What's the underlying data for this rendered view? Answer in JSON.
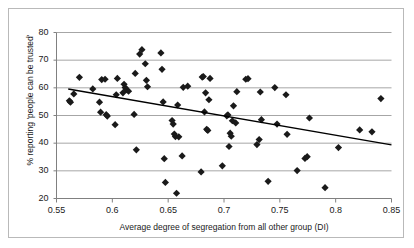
{
  "chart_data": {
    "type": "scatter",
    "title": "",
    "xlabel": "Average degree of segregation from all other group (DI)",
    "ylabel": "% reporting 'people can be trusted'",
    "xlim": [
      0.55,
      0.85
    ],
    "ylim": [
      20,
      80
    ],
    "xticks": [
      "0.55",
      "0.6",
      "0.65",
      "0.7",
      "0.75",
      "0.8",
      "0.85"
    ],
    "xtick_values": [
      0.55,
      0.6,
      0.65,
      0.7,
      0.75,
      0.8,
      0.85
    ],
    "yticks": [
      "80",
      "70",
      "60",
      "50",
      "40",
      "30",
      "20"
    ],
    "ytick_values": [
      80,
      70,
      60,
      50,
      40,
      30,
      20
    ],
    "grid": "horizontal",
    "legend": "none",
    "marker": "diamond",
    "marker_color": "#1a1a1a",
    "grid_color": "#a6a6a6",
    "axis_color": "#808080",
    "trendline_color": "#000000",
    "trendline": {
      "x": [
        0.5605,
        0.85
      ],
      "y": [
        59.6,
        39.4
      ]
    },
    "points": [
      {
        "x": 0.5615,
        "y": 55.3
      },
      {
        "x": 0.5625,
        "y": 54.8
      },
      {
        "x": 0.5655,
        "y": 57.8
      },
      {
        "x": 0.5705,
        "y": 63.8
      },
      {
        "x": 0.5825,
        "y": 59.6
      },
      {
        "x": 0.5885,
        "y": 54.8
      },
      {
        "x": 0.5895,
        "y": 51.2
      },
      {
        "x": 0.5905,
        "y": 63.0
      },
      {
        "x": 0.5935,
        "y": 63.1
      },
      {
        "x": 0.5945,
        "y": 50.3
      },
      {
        "x": 0.5955,
        "y": 49.8
      },
      {
        "x": 0.6025,
        "y": 46.7
      },
      {
        "x": 0.6035,
        "y": 57.5
      },
      {
        "x": 0.6045,
        "y": 63.4
      },
      {
        "x": 0.6095,
        "y": 58.2
      },
      {
        "x": 0.6105,
        "y": 61.3
      },
      {
        "x": 0.6115,
        "y": 60.1
      },
      {
        "x": 0.6125,
        "y": 59.3
      },
      {
        "x": 0.6145,
        "y": 58.8
      },
      {
        "x": 0.6195,
        "y": 50.4
      },
      {
        "x": 0.6205,
        "y": 65.2
      },
      {
        "x": 0.6215,
        "y": 37.6
      },
      {
        "x": 0.6245,
        "y": 72.2
      },
      {
        "x": 0.6265,
        "y": 73.8
      },
      {
        "x": 0.6295,
        "y": 68.7
      },
      {
        "x": 0.6305,
        "y": 62.7
      },
      {
        "x": 0.6315,
        "y": 60.4
      },
      {
        "x": 0.6435,
        "y": 72.6
      },
      {
        "x": 0.6445,
        "y": 66.7
      },
      {
        "x": 0.6455,
        "y": 54.9
      },
      {
        "x": 0.6465,
        "y": 34.4
      },
      {
        "x": 0.6475,
        "y": 25.8
      },
      {
        "x": 0.6535,
        "y": 48.2
      },
      {
        "x": 0.6545,
        "y": 46.9
      },
      {
        "x": 0.6555,
        "y": 43.3
      },
      {
        "x": 0.6565,
        "y": 42.4
      },
      {
        "x": 0.6575,
        "y": 21.9
      },
      {
        "x": 0.6585,
        "y": 53.8
      },
      {
        "x": 0.6595,
        "y": 42.3
      },
      {
        "x": 0.6625,
        "y": 35.4
      },
      {
        "x": 0.6635,
        "y": 60.2
      },
      {
        "x": 0.6675,
        "y": 60.6
      },
      {
        "x": 0.6795,
        "y": 29.6
      },
      {
        "x": 0.6805,
        "y": 63.9
      },
      {
        "x": 0.6815,
        "y": 64.1
      },
      {
        "x": 0.6825,
        "y": 51.3
      },
      {
        "x": 0.6835,
        "y": 58.2
      },
      {
        "x": 0.6845,
        "y": 45.0
      },
      {
        "x": 0.6855,
        "y": 44.6
      },
      {
        "x": 0.6865,
        "y": 55.7
      },
      {
        "x": 0.6875,
        "y": 63.4
      },
      {
        "x": 0.6985,
        "y": 31.8
      },
      {
        "x": 0.7025,
        "y": 49.9
      },
      {
        "x": 0.7035,
        "y": 50.2
      },
      {
        "x": 0.7045,
        "y": 38.8
      },
      {
        "x": 0.7055,
        "y": 43.6
      },
      {
        "x": 0.7065,
        "y": 42.5
      },
      {
        "x": 0.7075,
        "y": 48.1
      },
      {
        "x": 0.7085,
        "y": 53.5
      },
      {
        "x": 0.7105,
        "y": 47.3
      },
      {
        "x": 0.7115,
        "y": 58.6
      },
      {
        "x": 0.7195,
        "y": 63.1
      },
      {
        "x": 0.7215,
        "y": 63.3
      },
      {
        "x": 0.7295,
        "y": 39.5
      },
      {
        "x": 0.7315,
        "y": 41.3
      },
      {
        "x": 0.7325,
        "y": 58.5
      },
      {
        "x": 0.7335,
        "y": 48.5
      },
      {
        "x": 0.7395,
        "y": 26.2
      },
      {
        "x": 0.7455,
        "y": 60.1
      },
      {
        "x": 0.7475,
        "y": 46.9
      },
      {
        "x": 0.7555,
        "y": 57.5
      },
      {
        "x": 0.7565,
        "y": 43.2
      },
      {
        "x": 0.7655,
        "y": 30.1
      },
      {
        "x": 0.7725,
        "y": 34.5
      },
      {
        "x": 0.7745,
        "y": 35.1
      },
      {
        "x": 0.7765,
        "y": 49.1
      },
      {
        "x": 0.7905,
        "y": 23.9
      },
      {
        "x": 0.8025,
        "y": 38.4
      },
      {
        "x": 0.8215,
        "y": 44.8
      },
      {
        "x": 0.8325,
        "y": 44.1
      },
      {
        "x": 0.8405,
        "y": 56.1
      }
    ]
  }
}
